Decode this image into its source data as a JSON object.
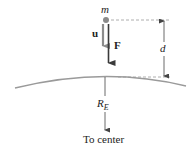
{
  "diagram": {
    "mass_label": "m",
    "velocity_label": "u",
    "force_label": "F",
    "distance_label": "d",
    "radius_label": "R",
    "radius_subscript": "E",
    "center_label": "To center"
  },
  "colors": {
    "mass_dot": "#8a8a8a",
    "velocity_arrow": "#8c8c8c",
    "force_arrow": "#3a3a3a",
    "surface_arc": "#9a9a9a",
    "dashed_line": "#9a9a9a",
    "dimension_line": "#444444",
    "text": "#222222"
  }
}
